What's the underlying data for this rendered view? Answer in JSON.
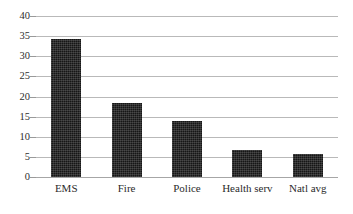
{
  "chart_data": {
    "type": "bar",
    "title": "",
    "subtitle": "",
    "xlabel": "",
    "ylabel": "",
    "categories": [
      "EMS",
      "Fire",
      "Police",
      "Health serv",
      "Natl avg"
    ],
    "values": [
      34.4,
      18.5,
      13.8,
      6.7,
      5.7
    ],
    "ylim": [
      0,
      40
    ],
    "ytick_step": 5,
    "yticks": [
      0,
      5,
      10,
      15,
      20,
      25,
      30,
      35,
      40
    ],
    "ytick_labels": [
      "0",
      "5",
      "10",
      "15",
      "20",
      "25",
      "30",
      "35",
      "40"
    ],
    "grid": true,
    "grid_axis": "y",
    "legend": false,
    "legend_position": "none",
    "bar_color": "#161616",
    "grid_color": "#b9b9b9",
    "background_color": "#ffffff",
    "annotations": []
  }
}
